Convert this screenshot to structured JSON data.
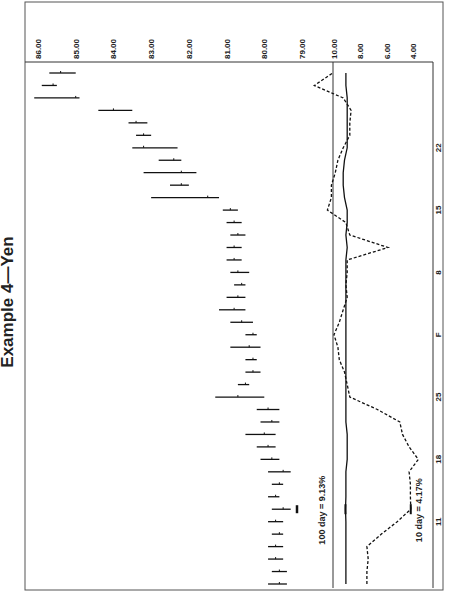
{
  "chart_data": {
    "type": "line",
    "title": "Example 4—Yen",
    "orientation": "rotated-90-clockwise",
    "price_panel": {
      "kind": "high-low-close bars",
      "ylim": [
        79,
        86
      ],
      "tick_labels": [
        "86.00",
        "85.00",
        "84.00",
        "83.00",
        "82.00",
        "81.00",
        "80.00",
        "79.00"
      ],
      "ticks": [
        86,
        85,
        84,
        83,
        82,
        81,
        80,
        79
      ],
      "bars": [
        {
          "low": 79.4,
          "high": 79.9,
          "close": 79.6
        },
        {
          "low": 79.4,
          "high": 79.8,
          "close": 79.6
        },
        {
          "low": 79.5,
          "high": 79.9,
          "close": 79.7
        },
        {
          "low": 79.5,
          "high": 79.9,
          "close": 79.7
        },
        {
          "low": 79.5,
          "high": 79.8,
          "close": 79.6
        },
        {
          "low": 79.5,
          "high": 79.9,
          "close": 79.7
        },
        {
          "low": 79.3,
          "high": 79.8,
          "close": 79.5
        },
        {
          "low": 79.6,
          "high": 79.9,
          "close": 79.7
        },
        {
          "low": 79.5,
          "high": 79.8,
          "close": 79.6
        },
        {
          "low": 79.3,
          "high": 79.9,
          "close": 79.5
        },
        {
          "low": 79.6,
          "high": 80.1,
          "close": 79.8
        },
        {
          "low": 79.7,
          "high": 80.2,
          "close": 79.9
        },
        {
          "low": 79.7,
          "high": 80.5,
          "close": 80.0
        },
        {
          "low": 79.6,
          "high": 80.1,
          "close": 79.8
        },
        {
          "low": 79.6,
          "high": 80.2,
          "close": 79.9
        },
        {
          "low": 80.0,
          "high": 81.3,
          "close": 80.7
        },
        {
          "low": 80.4,
          "high": 80.7,
          "close": 80.5
        },
        {
          "low": 80.1,
          "high": 80.5,
          "close": 80.3
        },
        {
          "low": 80.2,
          "high": 80.5,
          "close": 80.3
        },
        {
          "low": 80.1,
          "high": 80.9,
          "close": 80.4
        },
        {
          "low": 80.2,
          "high": 80.5,
          "close": 80.3
        },
        {
          "low": 80.3,
          "high": 80.9,
          "close": 80.6
        },
        {
          "low": 80.5,
          "high": 81.2,
          "close": 80.8
        },
        {
          "low": 80.5,
          "high": 81.0,
          "close": 80.7
        },
        {
          "low": 80.5,
          "high": 80.8,
          "close": 80.6
        },
        {
          "low": 80.4,
          "high": 80.9,
          "close": 80.7
        },
        {
          "low": 80.6,
          "high": 81.0,
          "close": 80.8
        },
        {
          "low": 80.6,
          "high": 81.0,
          "close": 80.8
        },
        {
          "low": 80.5,
          "high": 80.9,
          "close": 80.7
        },
        {
          "low": 80.6,
          "high": 81.0,
          "close": 80.8
        },
        {
          "low": 80.7,
          "high": 81.1,
          "close": 80.9
        },
        {
          "low": 81.2,
          "high": 83.0,
          "close": 81.5
        },
        {
          "low": 82.0,
          "high": 82.5,
          "close": 82.2
        },
        {
          "low": 81.8,
          "high": 83.2,
          "close": 82.2
        },
        {
          "low": 82.2,
          "high": 82.8,
          "close": 82.4
        },
        {
          "low": 82.3,
          "high": 83.5,
          "close": 83.2
        },
        {
          "low": 83.0,
          "high": 83.4,
          "close": 83.2
        },
        {
          "low": 83.1,
          "high": 83.6,
          "close": 83.4
        },
        {
          "low": 83.5,
          "high": 84.4,
          "close": 84.0
        },
        {
          "low": 84.9,
          "high": 86.1,
          "close": 85.0
        },
        {
          "low": 85.5,
          "high": 85.9,
          "close": 85.6
        },
        {
          "low": 85.0,
          "high": 85.7,
          "close": 85.4
        }
      ]
    },
    "volatility_panel": {
      "ylim": [
        3,
        11
      ],
      "tick_labels": [
        "10.00",
        "8.00",
        "6.00",
        "4.00"
      ],
      "ticks": [
        10,
        8,
        6,
        4
      ],
      "series": [
        {
          "name": "100 day",
          "style": "solid",
          "values": [
            9.1,
            9.1,
            9.1,
            9.1,
            9.1,
            9.1,
            9.13,
            9.1,
            9.1,
            9.1,
            9.0,
            9.0,
            9.0,
            9.1,
            9.1,
            9.1,
            9.1,
            9.1,
            9.1,
            9.1,
            9.1,
            9.1,
            9.1,
            9.1,
            9.1,
            9.1,
            9.1,
            9.0,
            9.1,
            9.0,
            9.0,
            9.2,
            9.3,
            9.3,
            9.2,
            9.0,
            9.0,
            9.0,
            9.0,
            9.0,
            9.1,
            9.1
          ]
        },
        {
          "name": "10 day",
          "style": "dashed",
          "values": [
            7.5,
            7.5,
            7.4,
            7.5,
            6.4,
            5.2,
            4.17,
            4.2,
            4.2,
            4.3,
            3.6,
            4.3,
            4.8,
            5.0,
            6.7,
            8.8,
            9.0,
            9.2,
            9.6,
            9.7,
            10.0,
            9.6,
            9.3,
            9.0,
            9.1,
            9.0,
            9.0,
            5.9,
            8.8,
            9.1,
            10.5,
            10.2,
            10.2,
            9.9,
            9.7,
            9.3,
            8.8,
            8.8,
            8.7,
            9.3,
            11.5,
            10.1
          ]
        }
      ]
    },
    "x_tick_labels": [
      {
        "label": "11",
        "index": 5
      },
      {
        "label": "18",
        "index": 10
      },
      {
        "label": "25",
        "index": 15
      },
      {
        "label": "F",
        "index": 20
      },
      {
        "label": "8",
        "index": 25
      },
      {
        "label": "15",
        "index": 30
      },
      {
        "label": "22",
        "index": 35
      }
    ],
    "annotations": [
      {
        "text": "100 day = 9.13%",
        "series": "100 day",
        "index": 6
      },
      {
        "text": "10 day = 4.17%",
        "series": "10 day",
        "index": 6
      }
    ]
  }
}
